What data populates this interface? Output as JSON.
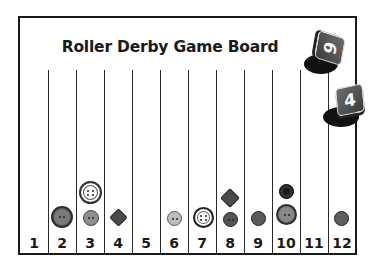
{
  "title": "Roller Derby Game Board",
  "columns": [
    {
      "label": "1",
      "tokens": []
    },
    {
      "label": "2",
      "tokens": [
        "large-gray-button"
      ]
    },
    {
      "label": "3",
      "tokens": [
        "small-gray-button",
        "large-white-button"
      ]
    },
    {
      "label": "4",
      "tokens": [
        "dark-diamond-button"
      ]
    },
    {
      "label": "5",
      "tokens": []
    },
    {
      "label": "6",
      "tokens": [
        "small-light-gray-button"
      ]
    },
    {
      "label": "7",
      "tokens": [
        "white-button"
      ]
    },
    {
      "label": "8",
      "tokens": [
        "dark-gray-button",
        "dark-diamond-button"
      ]
    },
    {
      "label": "9",
      "tokens": [
        "dark-gray-button"
      ]
    },
    {
      "label": "10",
      "tokens": [
        "large-gray-button",
        "black-button"
      ]
    },
    {
      "label": "11",
      "tokens": []
    },
    {
      "label": "12",
      "tokens": [
        "dark-gray-button"
      ]
    }
  ],
  "dice": [
    {
      "value": "6"
    },
    {
      "value": "4"
    }
  ],
  "colors": {
    "frame": "#1a1a1a",
    "die_face": "#555555",
    "shadow": "#111111"
  }
}
